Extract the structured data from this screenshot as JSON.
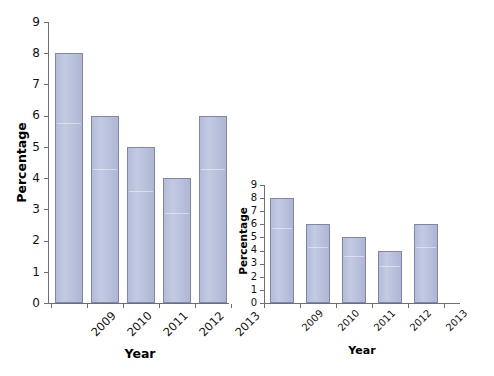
{
  "figure": {
    "background": "#ffffff",
    "bar_fill": "#b8c0dd",
    "bar_stroke": "#7d86b0",
    "axis_color": "#6b6f7a",
    "text_color": "#111111"
  },
  "chart_data": [
    {
      "id": "left",
      "type": "bar",
      "title": "",
      "xlabel": "Year",
      "ylabel": "Percentage",
      "categories": [
        "2009",
        "2010",
        "2011",
        "2012",
        "2013"
      ],
      "values": [
        8,
        6,
        5,
        4,
        6
      ],
      "yticks": [
        0,
        1,
        2,
        3,
        4,
        5,
        6,
        7,
        8,
        9
      ],
      "ytick_labels": [
        "0",
        "1",
        "2",
        "3",
        "4",
        "5",
        "6",
        "7",
        "8",
        "9"
      ],
      "ylim": [
        0,
        9
      ],
      "grid": false,
      "legend": "none",
      "xtick_rotation": -45,
      "note": "tall aspect ratio — exaggerates differences"
    },
    {
      "id": "right",
      "type": "bar",
      "title": "",
      "xlabel": "Year",
      "ylabel": "Percentage",
      "categories": [
        "2009",
        "2010",
        "2011",
        "2012",
        "2013"
      ],
      "values": [
        8,
        6,
        5,
        4,
        6
      ],
      "yticks": [
        0,
        1,
        2,
        3,
        4,
        5,
        6,
        7,
        8,
        9
      ],
      "ytick_labels": [
        "0",
        "1",
        "2",
        "3",
        "4",
        "5",
        "6",
        "7",
        "8",
        "9"
      ],
      "ylim": [
        0,
        9
      ],
      "grid": false,
      "legend": "none",
      "xtick_rotation": -45,
      "note": "compressed aspect ratio — minimizes differences"
    }
  ]
}
